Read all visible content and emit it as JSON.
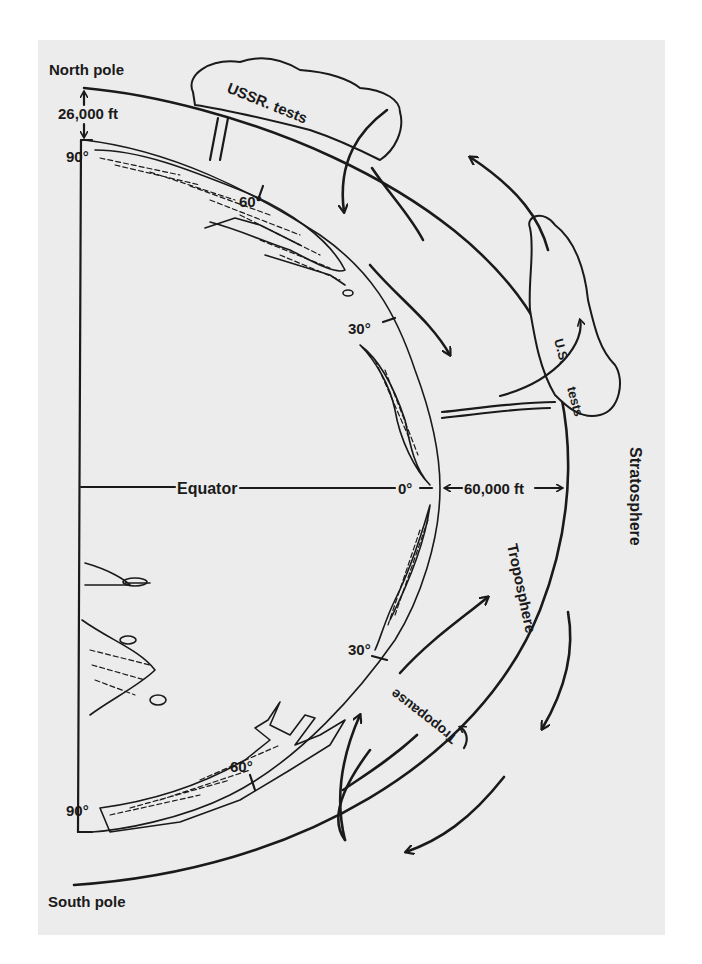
{
  "diagram": {
    "labels": {
      "north_pole": "North pole",
      "south_pole": "South pole",
      "tropopause_height_pole": "26,000 ft",
      "tropopause_height_equator": "60,000 ft",
      "equator": "Equator",
      "lat_90_north": "90°",
      "lat_60_north": "60°",
      "lat_30_north": "30°",
      "lat_0": "0°",
      "lat_30_south": "30°",
      "lat_60_south": "60°",
      "lat_90_south": "90°",
      "ussr_tests": "USSR. tests",
      "us_tests_1": "U.S.",
      "us_tests_2": "tests",
      "stratosphere": "Stratosphere",
      "troposphere": "Troposphere",
      "tropopause": "Tropopause"
    },
    "colors": {
      "ink": "#1a1a1a",
      "paper": "#ececec",
      "background": "#ffffff"
    }
  }
}
